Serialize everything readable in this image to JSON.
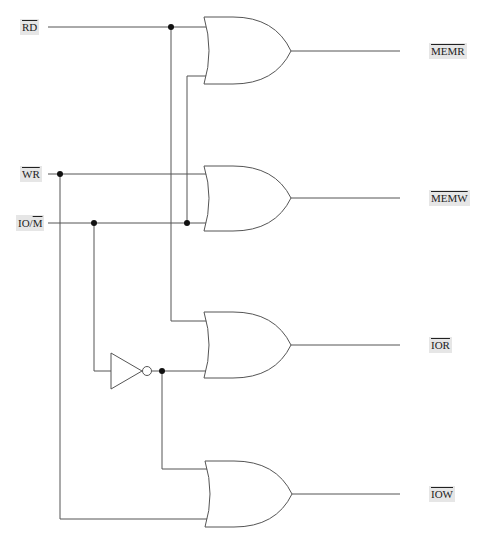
{
  "diagram": {
    "type": "logic-circuit",
    "inputs": [
      {
        "id": "rd",
        "text": "RD",
        "overline": "RD"
      },
      {
        "id": "wr",
        "text": "WR",
        "overline": "WR"
      },
      {
        "id": "iom",
        "prefix": "IO/",
        "overline": "M"
      }
    ],
    "outputs": [
      {
        "id": "memr",
        "overline": "MEMR"
      },
      {
        "id": "memw",
        "overline": "MEMW"
      },
      {
        "id": "ior",
        "overline": "IOR"
      },
      {
        "id": "iow",
        "overline": "IOW"
      }
    ],
    "gates": [
      {
        "type": "OR",
        "inputs": [
          "RD",
          "IO/M"
        ],
        "output": "MEMR"
      },
      {
        "type": "OR",
        "inputs": [
          "WR",
          "IO/M"
        ],
        "output": "MEMW"
      },
      {
        "type": "OR",
        "inputs": [
          "RD",
          "NOT(IO/M)"
        ],
        "output": "IOR"
      },
      {
        "type": "OR",
        "inputs": [
          "NOT(IO/M)",
          "WR"
        ],
        "output": "IOW"
      },
      {
        "type": "NOT",
        "inputs": [
          "IO/M"
        ],
        "output": "NOT(IO/M)"
      }
    ],
    "colors": {
      "wire": "#555555",
      "label_bg": "#e6e6e6",
      "junction": "#111111"
    }
  }
}
